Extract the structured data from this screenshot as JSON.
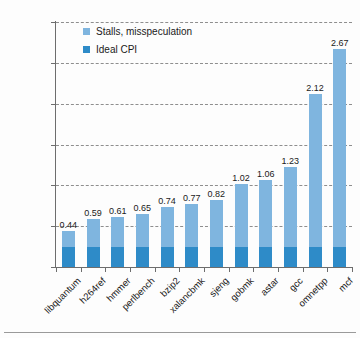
{
  "chart_data": {
    "type": "bar",
    "subtype": "stacked-bar",
    "title": "",
    "xlabel": "",
    "ylabel": "CPI",
    "ylim": [
      0,
      3
    ],
    "ytick_values": [
      "3",
      "2.5",
      "2",
      "1.5",
      "1",
      "0.5",
      "0"
    ],
    "grid": true,
    "legend_position": "top-left-inside",
    "categories": [
      "libquantum",
      "h264ref",
      "hmmer",
      "perlbench",
      "bzip2",
      "xalancbmk",
      "sjeng",
      "gobmk",
      "astar",
      "gcc",
      "omnetpp",
      "mcf"
    ],
    "totals": [
      0.44,
      0.59,
      0.61,
      0.65,
      0.74,
      0.77,
      0.82,
      1.02,
      1.06,
      1.23,
      2.12,
      2.67
    ],
    "data_labels": [
      "0.44",
      "0.59",
      "0.61",
      "0.65",
      "0.74",
      "0.77",
      "0.82",
      "1.02",
      "1.06",
      "1.23",
      "2.12",
      "2.67"
    ],
    "series": [
      {
        "name": "Ideal CPI",
        "color": "#2e8bc8",
        "values": [
          0.25,
          0.25,
          0.25,
          0.25,
          0.25,
          0.25,
          0.25,
          0.25,
          0.25,
          0.25,
          0.25,
          0.25
        ]
      },
      {
        "name": "Stalls, misspeculation",
        "color": "#7fb5df",
        "values": [
          0.19,
          0.34,
          0.36,
          0.4,
          0.49,
          0.52,
          0.57,
          0.77,
          0.81,
          0.98,
          1.87,
          2.42
        ]
      }
    ]
  },
  "legend": {
    "items": [
      {
        "label": "Stalls, misspeculation",
        "color": "#7fb5df"
      },
      {
        "label": "Ideal CPI",
        "color": "#2e8bc8"
      }
    ]
  },
  "axes": {
    "y_label": "CPI",
    "y_ticks": [
      "3",
      "2.5",
      "2",
      "1.5",
      "1",
      "0.5",
      "0"
    ],
    "x_ticks": [
      "libquantum",
      "h264ref",
      "hmmer",
      "perlbench",
      "bzip2",
      "xalancbmk",
      "sjeng",
      "gobmk",
      "astar",
      "gcc",
      "omnetpp",
      "mcf"
    ]
  },
  "bar_labels": [
    "0.44",
    "0.59",
    "0.61",
    "0.65",
    "0.74",
    "0.77",
    "0.82",
    "1.02",
    "1.06",
    "1.23",
    "2.12",
    "2.67"
  ]
}
